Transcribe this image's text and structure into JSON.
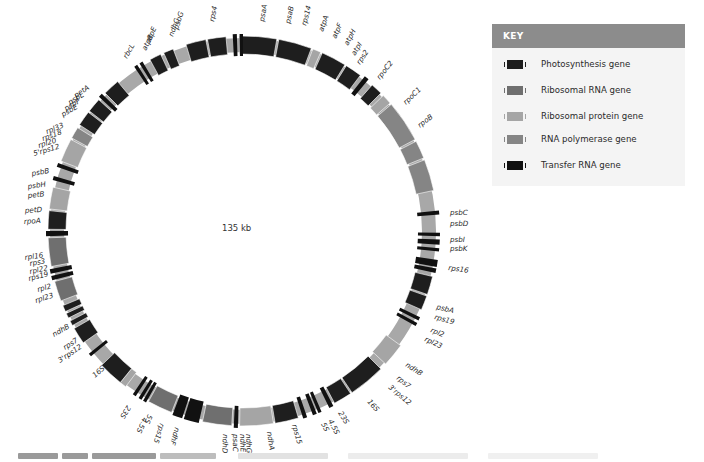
{
  "center": {
    "cx": 243,
    "cy": 231,
    "r_outer": 195,
    "r_inner": 177
  },
  "genome_size_label": "135 kb",
  "colors": {
    "photosynthesis": "#1e1e1e",
    "rrna": "#6f6f6f",
    "rprotein": "#a5a5a5",
    "rnapol": "#858585",
    "trna": "#111111",
    "backbone": "#a8a8a8",
    "label": "#2a2a2a"
  },
  "key": {
    "title": "KEY",
    "items": [
      {
        "label": "Photosynthesis gene",
        "color": "#1e1e1e"
      },
      {
        "label": "Ribosomal RNA gene",
        "color": "#6f6f6f"
      },
      {
        "label": "Ribosomal protein gene",
        "color": "#a5a5a5"
      },
      {
        "label": "RNA polymerase gene",
        "color": "#858585"
      },
      {
        "label": "Transfer RNA gene",
        "color": "#111111"
      }
    ]
  },
  "genes": [
    {
      "a1": -1,
      "a2": 10,
      "type": "photosynthesis"
    },
    {
      "a1": 10.6,
      "a2": 20.5,
      "type": "photosynthesis"
    },
    {
      "a1": 21,
      "a2": 23.5,
      "type": "rprotein"
    },
    {
      "a1": 24,
      "a2": 31.5,
      "type": "photosynthesis"
    },
    {
      "a1": 32,
      "a2": 37,
      "type": "photosynthesis"
    },
    {
      "a1": 38.2,
      "a2": 39.6,
      "type": "trna"
    },
    {
      "a1": 41.5,
      "a2": 45,
      "type": "photosynthesis"
    },
    {
      "a1": 46,
      "a2": 49,
      "type": "rprotein"
    },
    {
      "a1": 49.5,
      "a2": 62,
      "type": "rnapol"
    },
    {
      "a1": 62.6,
      "a2": 68,
      "type": "rnapol"
    },
    {
      "a1": 68.6,
      "a2": 78,
      "type": "rnapol"
    },
    {
      "a1": 84,
      "a2": 85.2,
      "type": "trna"
    },
    {
      "a1": 90.5,
      "a2": 91.5,
      "type": "trna"
    },
    {
      "a1": 92.5,
      "a2": 94,
      "type": "trna"
    },
    {
      "a1": 95,
      "a2": 96,
      "type": "trna"
    },
    {
      "a1": 98.5,
      "a2": 100.5,
      "type": "trna"
    },
    {
      "a1": 101,
      "a2": 102.3,
      "type": "trna"
    },
    {
      "a1": 103.5,
      "a2": 109,
      "type": "photosynthesis"
    },
    {
      "a1": 109.5,
      "a2": 113.8,
      "type": "photosynthesis"
    },
    {
      "a1": 116,
      "a2": 117,
      "type": "trna"
    },
    {
      "a1": 117.8,
      "a2": 118.8,
      "type": "trna"
    },
    {
      "a1": 126,
      "a2": 133,
      "type": "rprotein"
    },
    {
      "a1": 135,
      "a2": 146,
      "type": "photosynthesis"
    },
    {
      "a1": 146.5,
      "a2": 152,
      "type": "photosynthesis"
    },
    {
      "a1": 152.7,
      "a2": 154,
      "type": "trna"
    },
    {
      "a1": 156.5,
      "a2": 157.5,
      "type": "trna"
    },
    {
      "a1": 158,
      "a2": 159.2,
      "type": "trna"
    },
    {
      "a1": 161,
      "a2": 162.2,
      "type": "trna"
    },
    {
      "a1": 163.5,
      "a2": 170.5,
      "type": "photosynthesis"
    },
    {
      "a1": 171,
      "a2": 181,
      "type": "rprotein"
    },
    {
      "a1": 181.5,
      "a2": 182.7,
      "type": "trna"
    },
    {
      "a1": 183.3,
      "a2": 192,
      "type": "rrna"
    },
    {
      "a1": 193,
      "a2": 197.5,
      "type": "trna"
    },
    {
      "a1": 198,
      "a2": 201,
      "type": "trna"
    },
    {
      "a1": 201.5,
      "a2": 209,
      "type": "rrna"
    },
    {
      "a1": 209.5,
      "a2": 210.5,
      "type": "trna"
    },
    {
      "a1": 211,
      "a2": 212,
      "type": "trna"
    },
    {
      "a1": 213,
      "a2": 214,
      "type": "trna"
    },
    {
      "a1": 217,
      "a2": 219,
      "type": "rprotein"
    },
    {
      "a1": 219,
      "a2": 226.5,
      "type": "photosynthesis"
    },
    {
      "a1": 230.5,
      "a2": 231.5,
      "type": "trna"
    },
    {
      "a1": 235,
      "a2": 240,
      "type": "photosynthesis"
    },
    {
      "a1": 241,
      "a2": 242.5,
      "type": "photosynthesis"
    },
    {
      "a1": 243.5,
      "a2": 245,
      "type": "photosynthesis"
    },
    {
      "a1": 245.6,
      "a2": 247.5,
      "type": "photosynthesis"
    },
    {
      "a1": 249,
      "a2": 255,
      "type": "rrna"
    },
    {
      "a1": 255.5,
      "a2": 256.8,
      "type": "trna"
    },
    {
      "a1": 257.5,
      "a2": 258.8,
      "type": "trna"
    },
    {
      "a1": 259.5,
      "a2": 268,
      "type": "rrna"
    },
    {
      "a1": 268.5,
      "a2": 270,
      "type": "trna"
    },
    {
      "a1": 270.5,
      "a2": 276,
      "type": "photosynthesis"
    },
    {
      "a1": 276.5,
      "a2": 283,
      "type": "rprotein"
    },
    {
      "a1": 285,
      "a2": 286.2,
      "type": "trna"
    },
    {
      "a1": 289,
      "a2": 290.2,
      "type": "trna"
    },
    {
      "a1": 291,
      "a2": 298,
      "type": "rprotein"
    },
    {
      "a1": 298.5,
      "a2": 302,
      "type": "rnapol"
    },
    {
      "a1": 303,
      "a2": 307.5,
      "type": "photosynthesis"
    },
    {
      "a1": 308,
      "a2": 312.3,
      "type": "photosynthesis"
    },
    {
      "a1": 313,
      "a2": 314.2,
      "type": "trna"
    },
    {
      "a1": 315,
      "a2": 320,
      "type": "photosynthesis"
    },
    {
      "a1": 326.5,
      "a2": 327.5,
      "type": "trna"
    },
    {
      "a1": 328.3,
      "a2": 329.3,
      "type": "trna"
    },
    {
      "a1": 331.5,
      "a2": 335,
      "type": "photosynthesis"
    },
    {
      "a1": 336,
      "a2": 339,
      "type": "photosynthesis"
    },
    {
      "a1": 343,
      "a2": 349,
      "type": "photosynthesis"
    },
    {
      "a1": 349.5,
      "a2": 355,
      "type": "photosynthesis"
    },
    {
      "a1": 357,
      "a2": 358.2,
      "type": "trna"
    },
    {
      "a1": 359,
      "a2": 360,
      "type": "trna"
    }
  ],
  "labels": [
    {
      "text": "psaA",
      "x": 264,
      "y": 22,
      "rot": -80
    },
    {
      "text": "psaB",
      "x": 290,
      "y": 24,
      "rot": -78
    },
    {
      "text": "rps14",
      "x": 306,
      "y": 26,
      "rot": -75
    },
    {
      "text": "atpA",
      "x": 323,
      "y": 32,
      "rot": -70
    },
    {
      "text": "atpF",
      "x": 336,
      "y": 39,
      "rot": -66
    },
    {
      "text": "atpH",
      "x": 348,
      "y": 46,
      "rot": -62
    },
    {
      "text": "atpI",
      "x": 355,
      "y": 56,
      "rot": -58
    },
    {
      "text": "rps2",
      "x": 360,
      "y": 65,
      "rot": -56
    },
    {
      "text": "rpoC2",
      "x": 380,
      "y": 80,
      "rot": -52
    },
    {
      "text": "rpoC1",
      "x": 406,
      "y": 105,
      "rot": -44
    },
    {
      "text": "rpoB",
      "x": 420,
      "y": 128,
      "rot": -38
    },
    {
      "text": "psbC",
      "x": 450,
      "y": 215,
      "rot": 0
    },
    {
      "text": "psbD",
      "x": 450,
      "y": 226,
      "rot": 0
    },
    {
      "text": "psbI",
      "x": 450,
      "y": 242,
      "rot": 0
    },
    {
      "text": "psbK",
      "x": 450,
      "y": 251,
      "rot": 0
    },
    {
      "text": "rps16",
      "x": 448,
      "y": 270,
      "rot": 8
    },
    {
      "text": "psbA",
      "x": 436,
      "y": 309,
      "rot": 14
    },
    {
      "text": "rps19",
      "x": 434,
      "y": 319,
      "rot": 16
    },
    {
      "text": "rpl2",
      "x": 430,
      "y": 332,
      "rot": 22
    },
    {
      "text": "rpl23",
      "x": 424,
      "y": 341,
      "rot": 24
    },
    {
      "text": "ndhB",
      "x": 405,
      "y": 366,
      "rot": 33
    },
    {
      "text": "rps7",
      "x": 396,
      "y": 379,
      "rot": 38
    },
    {
      "text": "3'rps12",
      "x": 388,
      "y": 388,
      "rot": 40
    },
    {
      "text": "16S",
      "x": 367,
      "y": 402,
      "rot": 48
    },
    {
      "text": "23S",
      "x": 338,
      "y": 413,
      "rot": 58
    },
    {
      "text": "4.5S",
      "x": 328,
      "y": 421,
      "rot": 62
    },
    {
      "text": "5S",
      "x": 321,
      "y": 424,
      "rot": 64
    },
    {
      "text": "rps15",
      "x": 292,
      "y": 425,
      "rot": 74
    },
    {
      "text": "ndhA",
      "x": 267,
      "y": 432,
      "rot": 82
    },
    {
      "text": "ndhG",
      "x": 246,
      "y": 434,
      "rot": 88
    },
    {
      "text": "ndhE",
      "x": 240,
      "y": 434,
      "rot": 88
    },
    {
      "text": "psaC",
      "x": 233,
      "y": 434,
      "rot": 90
    },
    {
      "text": "ndhD",
      "x": 223,
      "y": 434,
      "rot": 92
    },
    {
      "text": "ndhF",
      "x": 175,
      "y": 427,
      "rot": 106
    },
    {
      "text": "rps15",
      "x": 160,
      "y": 423,
      "rot": 108
    },
    {
      "text": "5S",
      "x": 148,
      "y": 414,
      "rot": 112
    },
    {
      "text": "4.5S",
      "x": 143,
      "y": 417,
      "rot": 114
    },
    {
      "text": "23S",
      "x": 127,
      "y": 405,
      "rot": 122
    },
    {
      "text": "16S",
      "x": 95,
      "y": 378,
      "rot": -42
    },
    {
      "text": "3'rps12",
      "x": 60,
      "y": 363,
      "rot": -34
    },
    {
      "text": "rps7",
      "x": 65,
      "y": 350,
      "rot": -32
    },
    {
      "text": "ndhB",
      "x": 54,
      "y": 337,
      "rot": -30
    },
    {
      "text": "rpl23",
      "x": 36,
      "y": 303,
      "rot": -18
    },
    {
      "text": "rpl2",
      "x": 38,
      "y": 292,
      "rot": -16
    },
    {
      "text": "rps19",
      "x": 29,
      "y": 281,
      "rot": -14
    },
    {
      "text": "rpl22",
      "x": 30,
      "y": 274,
      "rot": -12
    },
    {
      "text": "rps3",
      "x": 30,
      "y": 266,
      "rot": -10
    },
    {
      "text": "rpl16",
      "x": 25,
      "y": 260,
      "rot": -8
    },
    {
      "text": "rpoA",
      "x": 24,
      "y": 224,
      "rot": -4
    },
    {
      "text": "petD",
      "x": 25,
      "y": 213,
      "rot": -4
    },
    {
      "text": "petB",
      "x": 28,
      "y": 198,
      "rot": -6
    },
    {
      "text": "psbH",
      "x": 28,
      "y": 189,
      "rot": -8
    },
    {
      "text": "psbB",
      "x": 32,
      "y": 176,
      "rot": -10
    },
    {
      "text": "5'rps12",
      "x": 34,
      "y": 156,
      "rot": -16
    },
    {
      "text": "rpl20",
      "x": 39,
      "y": 148,
      "rot": -18
    },
    {
      "text": "rps18",
      "x": 43,
      "y": 141,
      "rot": -20
    },
    {
      "text": "rpl33",
      "x": 47,
      "y": 134,
      "rot": -22
    },
    {
      "text": "psbE",
      "x": 63,
      "y": 117,
      "rot": -30
    },
    {
      "text": "psbF",
      "x": 66,
      "y": 111,
      "rot": -30
    },
    {
      "text": "psbL",
      "x": 70,
      "y": 105,
      "rot": -32
    },
    {
      "text": "petA",
      "x": 76,
      "y": 98,
      "rot": -34
    },
    {
      "text": "rbcL",
      "x": 127,
      "y": 59,
      "rot": -60
    },
    {
      "text": "atpB",
      "x": 146,
      "y": 51,
      "rot": -64
    },
    {
      "text": "atpE",
      "x": 150,
      "y": 43,
      "rot": -66
    },
    {
      "text": "ndhC",
      "x": 173,
      "y": 37,
      "rot": -70
    },
    {
      "text": "psbG",
      "x": 178,
      "y": 30,
      "rot": -72
    },
    {
      "text": "rps4",
      "x": 214,
      "y": 22,
      "rot": -78
    }
  ],
  "caption": {
    "visible": true
  }
}
